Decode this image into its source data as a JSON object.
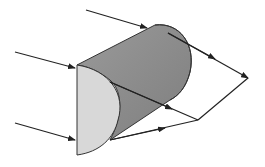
{
  "diagram": {
    "colors": {
      "background": "#ffffff",
      "cylinder_body": "#8c8c8c",
      "cylinder_cap": "#999999",
      "front_face": "#d9d9d9",
      "stroke": "#333333"
    },
    "incoming_rays": 3,
    "labels": []
  }
}
